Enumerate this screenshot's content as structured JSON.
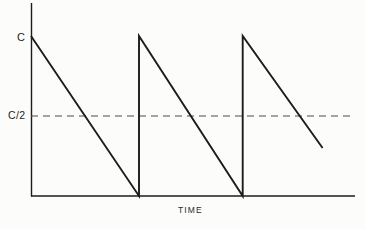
{
  "figure": {
    "background_color": "#fcfcfa",
    "line_color": "#1c1c1c",
    "dash_color": "#4a4a4a"
  },
  "labels": {
    "y_peak": "C",
    "y_half": "C/2",
    "x_axis": "TIME"
  },
  "chart_data": {
    "type": "line",
    "title": "",
    "xlabel": "TIME",
    "ylabel": "",
    "grid": false,
    "legend": null,
    "xlim": [
      0,
      3.0
    ],
    "ylim": [
      0,
      1.0
    ],
    "ytick_labels": [
      "C/2",
      "C"
    ],
    "ytick_values": [
      0.5,
      1.0
    ],
    "xtick_labels": [],
    "annotations": [
      {
        "text": "C",
        "y": 1.0,
        "position": "y-axis-tick"
      },
      {
        "text": "C/2",
        "y": 0.5,
        "position": "y-axis-tick"
      },
      {
        "text": "TIME",
        "position": "x-axis-label"
      }
    ],
    "reference_lines": [
      {
        "orientation": "horizontal",
        "value": 0.5,
        "style": "dashed",
        "label": "C/2",
        "x_start": 0.0,
        "x_end": 2.95
      }
    ],
    "series": [
      {
        "name": "sawtooth",
        "style": "solid",
        "points": [
          {
            "x": 0.0,
            "y": 1.0
          },
          {
            "x": 1.0,
            "y": 0.0
          },
          {
            "x": 1.0,
            "y": 1.0
          },
          {
            "x": 1.96,
            "y": 0.0
          },
          {
            "x": 1.96,
            "y": 1.0
          },
          {
            "x": 2.7,
            "y": 0.3
          }
        ]
      }
    ],
    "geometry_px": {
      "y_axis_x": 31,
      "y_axis_top": 3,
      "x_axis_y": 196,
      "x_axis_right": 355,
      "peak_y": 36,
      "half_y": 116,
      "dash_right": 350,
      "ramp1_end_x": 140,
      "ramp2_end_x": 245,
      "ramp3_end": {
        "x": 325,
        "y": 148
      }
    }
  }
}
